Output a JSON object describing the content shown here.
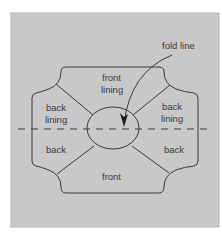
{
  "diagram": {
    "colors": {
      "page_background": "#ffffff",
      "panel_fill": "#c8c8c8",
      "panel_border": "#b4b4b4",
      "line": "#3a3a3a",
      "text": "#3a3a3a"
    },
    "labels": {
      "fold_line": "fold line",
      "front_lining_line1": "front",
      "front_lining_line2": "lining",
      "back_lining_left_line1": "back",
      "back_lining_left_line2": "lining",
      "back_lining_right_line1": "back",
      "back_lining_right_line2": "lining",
      "back_left": "back",
      "back_right": "back",
      "front": "front"
    },
    "regions": [
      {
        "name": "front lining",
        "position": "top"
      },
      {
        "name": "back lining",
        "position": "upper-left"
      },
      {
        "name": "back lining",
        "position": "upper-right"
      },
      {
        "name": "back",
        "position": "lower-left"
      },
      {
        "name": "back",
        "position": "lower-right"
      },
      {
        "name": "front",
        "position": "bottom"
      }
    ],
    "annotations": [
      {
        "label": "fold line",
        "type": "curved-arrow",
        "target": "horizontal dashed line through center opening"
      }
    ]
  }
}
